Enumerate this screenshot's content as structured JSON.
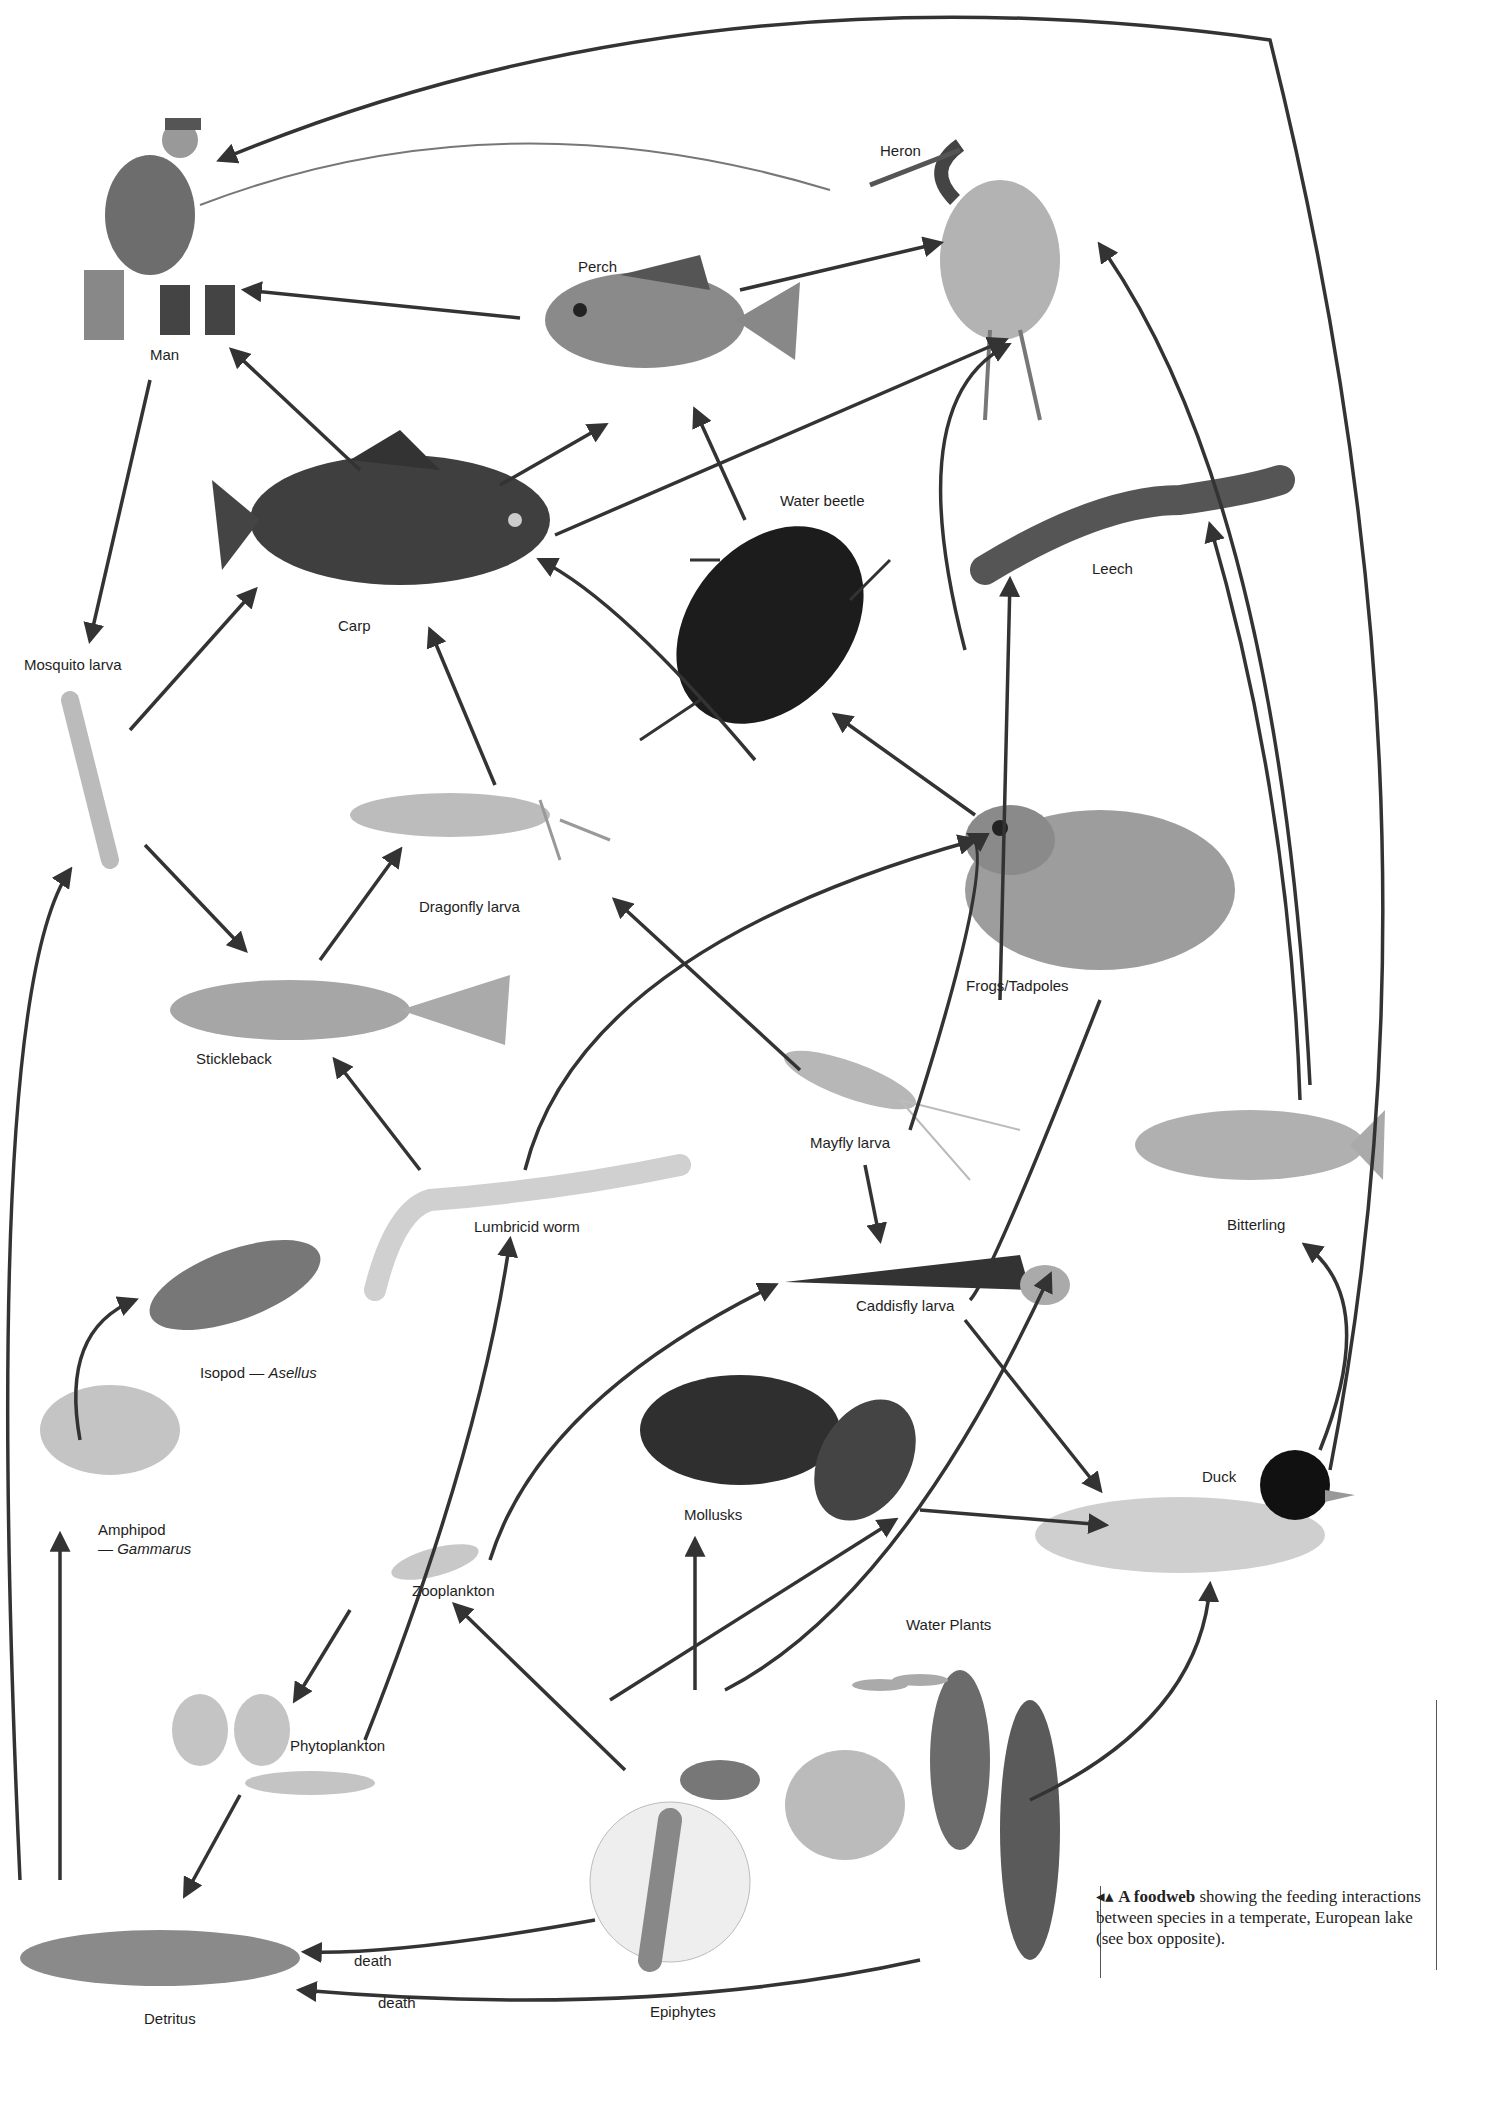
{
  "diagram": {
    "nodes": [
      {
        "id": "man",
        "label": "Man",
        "x": 150,
        "y": 355
      },
      {
        "id": "perch",
        "label": "Perch",
        "x": 578,
        "y": 258
      },
      {
        "id": "heron",
        "label": "Heron",
        "x": 880,
        "y": 142
      },
      {
        "id": "carp",
        "label": "Carp",
        "x": 338,
        "y": 617
      },
      {
        "id": "water_beetle",
        "label": "Water beetle",
        "x": 780,
        "y": 492
      },
      {
        "id": "leech",
        "label": "Leech",
        "x": 1092,
        "y": 560
      },
      {
        "id": "mosquito_larva",
        "label": "Mosquito larva",
        "x": 24,
        "y": 656
      },
      {
        "id": "dragonfly_larva",
        "label": "Dragonfly larva",
        "x": 419,
        "y": 898
      },
      {
        "id": "frogs_tadpoles",
        "label": "Frogs/Tadpoles",
        "x": 966,
        "y": 977
      },
      {
        "id": "stickleback",
        "label": "Stickleback",
        "x": 196,
        "y": 1050
      },
      {
        "id": "mayfly_larva",
        "label": "Mayfly larva",
        "x": 810,
        "y": 1134
      },
      {
        "id": "bitterling",
        "label": "Bitterling",
        "x": 1227,
        "y": 1216
      },
      {
        "id": "lumbricid_worm",
        "label": "Lumbricid worm",
        "x": 474,
        "y": 1218
      },
      {
        "id": "caddisfly_larva",
        "label": "Caddisfly larva",
        "x": 856,
        "y": 1297
      },
      {
        "id": "isopod",
        "label": "Isopod — ",
        "label_italic": "Asellus",
        "x": 200,
        "y": 1364
      },
      {
        "id": "amphipod",
        "label": "Amphipod",
        "label2_prefix": "— ",
        "label_italic": "Gammarus",
        "x": 98,
        "y": 1520
      },
      {
        "id": "mollusks",
        "label": "Mollusks",
        "x": 684,
        "y": 1506
      },
      {
        "id": "duck",
        "label": "Duck",
        "x": 1202,
        "y": 1468
      },
      {
        "id": "zooplankton",
        "label": "Zooplankton",
        "x": 412,
        "y": 1582
      },
      {
        "id": "water_plants",
        "label": "Water Plants",
        "x": 906,
        "y": 1616
      },
      {
        "id": "phytoplankton",
        "label": "Phytoplankton",
        "x": 290,
        "y": 1737
      },
      {
        "id": "detritus",
        "label": "Detritus",
        "x": 144,
        "y": 2010
      },
      {
        "id": "epiphytes",
        "label": "Epiphytes",
        "x": 650,
        "y": 2003
      }
    ],
    "edge_labels": [
      {
        "text": "death",
        "x": 354,
        "y": 1952
      },
      {
        "text": "death",
        "x": 378,
        "y": 1994
      }
    ],
    "edges": [
      [
        "perch",
        "man"
      ],
      [
        "carp",
        "man"
      ],
      [
        "perch",
        "heron"
      ],
      [
        "carp",
        "heron"
      ],
      [
        "carp",
        "perch"
      ],
      [
        "water_beetle",
        "perch"
      ],
      [
        "man",
        "mosquito_larva"
      ],
      [
        "mosquito_larva",
        "carp"
      ],
      [
        "mosquito_larva",
        "stickleback"
      ],
      [
        "dragonfly_larva",
        "carp"
      ],
      [
        "water_beetle",
        "carp"
      ],
      [
        "stickleback",
        "dragonfly_larva"
      ],
      [
        "frogs_tadpoles",
        "water_beetle"
      ],
      [
        "frogs_tadpoles",
        "leech"
      ],
      [
        "frogs_tadpoles",
        "heron"
      ],
      [
        "bitterling",
        "leech"
      ],
      [
        "bitterling",
        "heron"
      ],
      [
        "lumbricid_worm",
        "stickleback"
      ],
      [
        "lumbricid_worm",
        "frogs_tadpoles"
      ],
      [
        "mayfly_larva",
        "dragonfly_larva"
      ],
      [
        "mayfly_larva",
        "caddisfly_larva"
      ],
      [
        "mayfly_larva",
        "frogs_tadpoles"
      ],
      [
        "mollusks",
        "duck"
      ],
      [
        "caddisfly_larva",
        "duck"
      ],
      [
        "duck",
        "man"
      ],
      [
        "water_plants",
        "bitterling"
      ],
      [
        "water_plants",
        "mollusks"
      ],
      [
        "water_plants",
        "caddisfly_larva"
      ],
      [
        "water_plants",
        "duck"
      ],
      [
        "epiphytes",
        "mollusks"
      ],
      [
        "epiphytes",
        "zooplankton"
      ],
      [
        "zooplankton",
        "phytoplankton"
      ],
      [
        "phytoplankton",
        "detritus"
      ],
      [
        "detritus",
        "amphipod"
      ],
      [
        "detritus",
        "mosquito_larva"
      ],
      [
        "amphipod",
        "isopod"
      ],
      [
        "zooplankton",
        "lumbricid_worm"
      ],
      [
        "zooplankton",
        "caddisfly_larva"
      ],
      [
        "epiphytes",
        "detritus"
      ],
      [
        "water_plants",
        "detritus"
      ]
    ]
  },
  "caption": {
    "marker": "◂▴",
    "bold": "A foodweb",
    "text": " showing the feeding interactions between species in a temperate, European lake (see box opposite)."
  }
}
